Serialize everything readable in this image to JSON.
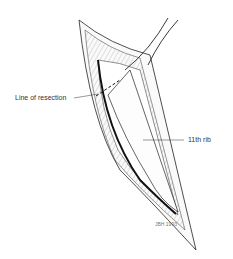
{
  "figure": {
    "type": "surgical illustration",
    "labels": {
      "line_of_resection": "Line of resection",
      "rib": "11th rib"
    },
    "signature": "JBH 1993"
  }
}
